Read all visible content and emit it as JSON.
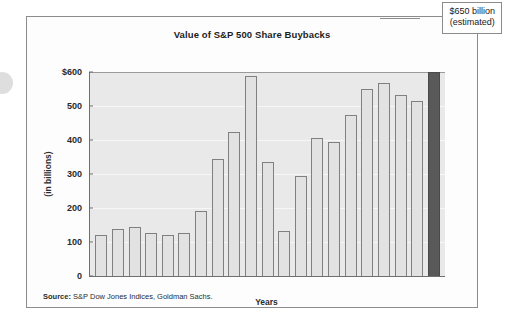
{
  "chart_data": {
    "type": "bar",
    "title": "Value of S&P 500 Share Buybacks",
    "xlabel": "Years",
    "ylabel": "(in billions)",
    "ylim": [
      0,
      600
    ],
    "ytick_labels": [
      "$600",
      "500",
      "400",
      "300",
      "200",
      "100",
      "0"
    ],
    "ytick_values": [
      600,
      500,
      400,
      300,
      200,
      100,
      0
    ],
    "grid": true,
    "legend": "none",
    "categories": [
      1998,
      1999,
      2000,
      2001,
      2002,
      2003,
      2004,
      2005,
      2006,
      2007,
      2008,
      2009,
      2010,
      2011,
      2012,
      2013,
      2014,
      2015,
      2016,
      2017,
      2018
    ],
    "xtick_labels": [
      "1998",
      "",
      "2000",
      "",
      "2002",
      "",
      "2004",
      "",
      "2006",
      "",
      "2008",
      "",
      "2010",
      "",
      "2012",
      "",
      "2014",
      "",
      "2016",
      "",
      "2018"
    ],
    "values": [
      120,
      139,
      144,
      126,
      121,
      127,
      191,
      345,
      425,
      589,
      335,
      133,
      293,
      405,
      393,
      475,
      551,
      568,
      532,
      515,
      650
    ],
    "highlight_index": 20,
    "annotations": [
      {
        "target_year": 2018,
        "line1": "$650 billion",
        "line2": "(estimated)"
      }
    ],
    "source_prefix": "Source:",
    "source_text": "S&P Dow Jones Indices, Goldman Sachs.",
    "colors": {
      "bar_fill": "#e2e2e2",
      "bar_stroke": "#808080",
      "highlight_fill": "#595959",
      "plot_background": "#e9e9e9",
      "gridline": "#f7f7f7",
      "axis": "#6f6f6f",
      "frame": "#8c8c8c",
      "text": "#1a1a1a"
    }
  }
}
